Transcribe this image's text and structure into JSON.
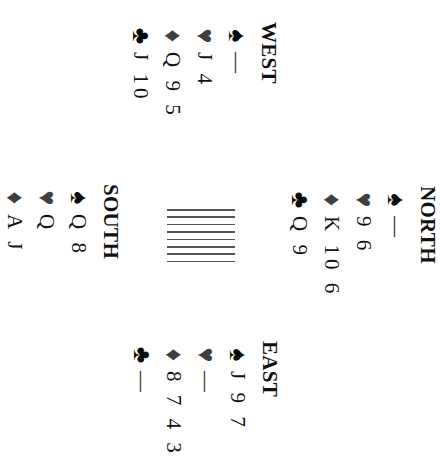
{
  "diagram": {
    "orientation": "rotated-90-clockwise",
    "center_glyph": {
      "type": "table-lines",
      "line_count": 8
    },
    "colors": {
      "black_suits": "#0a0a0a",
      "red_suits": "#3f3f3f",
      "background": "#ffffff"
    },
    "hands": {
      "west": {
        "seat": "WEST",
        "spades": {
          "symbol": "♠",
          "cards": "—"
        },
        "hearts": {
          "symbol": "♥",
          "cards": "J 4"
        },
        "diamonds": {
          "symbol": "♦",
          "cards": "Q 9 5"
        },
        "clubs": {
          "symbol": "♣",
          "cards": "J 10"
        }
      },
      "north": {
        "seat": "NORTH",
        "spades": {
          "symbol": "♠",
          "cards": "—"
        },
        "hearts": {
          "symbol": "♥",
          "cards": "9 6"
        },
        "diamonds": {
          "symbol": "♦",
          "cards": "K 10 6"
        },
        "clubs": {
          "symbol": "♣",
          "cards": "Q 9"
        }
      },
      "south": {
        "seat": "SOUTH",
        "spades": {
          "symbol": "♠",
          "cards": "Q 8"
        },
        "hearts": {
          "symbol": "♥",
          "cards": "Q"
        },
        "diamonds": {
          "symbol": "♦",
          "cards": "A J"
        }
      },
      "east": {
        "seat": "EAST",
        "spades": {
          "symbol": "♠",
          "cards": "J 9 7"
        },
        "hearts": {
          "symbol": "♥",
          "cards": "—"
        },
        "diamonds": {
          "symbol": "♦",
          "cards": "8 7 4 3"
        },
        "clubs": {
          "symbol": "♣",
          "cards": "—"
        }
      }
    }
  }
}
